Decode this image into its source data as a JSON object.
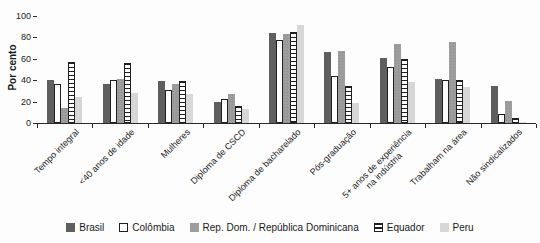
{
  "chart_data": {
    "type": "bar",
    "title": "",
    "ylabel": "Por cento",
    "xlabel": "",
    "ylim": [
      0,
      100
    ],
    "y_ticks": [
      0,
      20,
      40,
      60,
      80,
      100
    ],
    "grid": false,
    "legend_position": "bottom",
    "categories": [
      "Tempo integral",
      "<40 anos de idade",
      "Mulheres",
      "Diploma de CSCD",
      "Diploma de bacharelado",
      "Pós-graduação",
      "5+ anos de experiência\nna indústria",
      "Trabalham na área",
      "Não sindicalizados"
    ],
    "series": [
      {
        "name": "Brasil",
        "pattern": "solid",
        "color": "#5f5f5f",
        "values": [
          40,
          36,
          39,
          20,
          84,
          66,
          61,
          41,
          35
        ]
      },
      {
        "name": "Colômbia",
        "pattern": "outline",
        "color": "#ffffff",
        "values": [
          36,
          40,
          31,
          22,
          78,
          44,
          52,
          40,
          8
        ]
      },
      {
        "name": "Rep. Dom. / República Dominicana",
        "pattern": "dots",
        "color": "#9d9d9d",
        "values": [
          14,
          41,
          36,
          27,
          83,
          67,
          74,
          76,
          21
        ]
      },
      {
        "name": "Equador",
        "pattern": "hstripes",
        "color": "#ffffff",
        "values": [
          57,
          56,
          39,
          16,
          85,
          35,
          60,
          40,
          5
        ]
      },
      {
        "name": "Peru",
        "pattern": "solid",
        "color": "#d7d7d7",
        "values": [
          24,
          28,
          27,
          13,
          92,
          19,
          38,
          34,
          1
        ]
      }
    ],
    "axis_color": "#2a2a2a",
    "text_color": "#1a1a1a"
  }
}
